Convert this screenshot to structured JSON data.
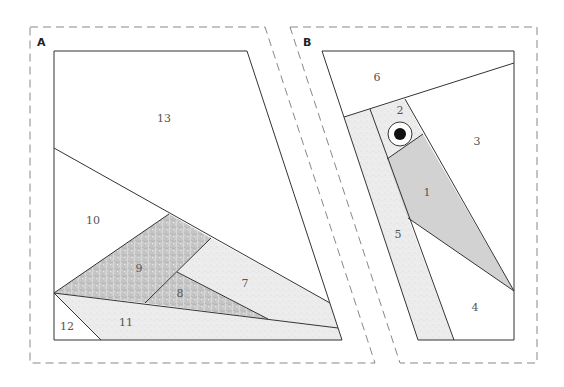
{
  "panels": [
    {
      "id": "A",
      "label": "A",
      "pieces": [
        {
          "number": "13",
          "fill": "plain"
        },
        {
          "number": "10",
          "fill": "plain"
        },
        {
          "number": "9",
          "fill": "dark-texture"
        },
        {
          "number": "8",
          "fill": "dark-texture"
        },
        {
          "number": "7",
          "fill": "light-texture"
        },
        {
          "number": "11",
          "fill": "light-texture"
        },
        {
          "number": "12",
          "fill": "plain"
        }
      ]
    },
    {
      "id": "B",
      "label": "B",
      "pieces": [
        {
          "number": "6",
          "fill": "plain"
        },
        {
          "number": "2",
          "fill": "light-texture"
        },
        {
          "number": "3",
          "fill": "plain"
        },
        {
          "number": "1",
          "fill": "solid-gray"
        },
        {
          "number": "5",
          "fill": "light-texture"
        },
        {
          "number": "4",
          "fill": "plain"
        }
      ],
      "eye": {
        "present": true
      }
    }
  ],
  "colors": {
    "line": "#333333",
    "dashed_outline": "#888888",
    "light_texture": "#e8e8e8",
    "dark_texture": "#c4c4c4",
    "solid_gray": "#d2d2d2",
    "label": "#555555"
  }
}
